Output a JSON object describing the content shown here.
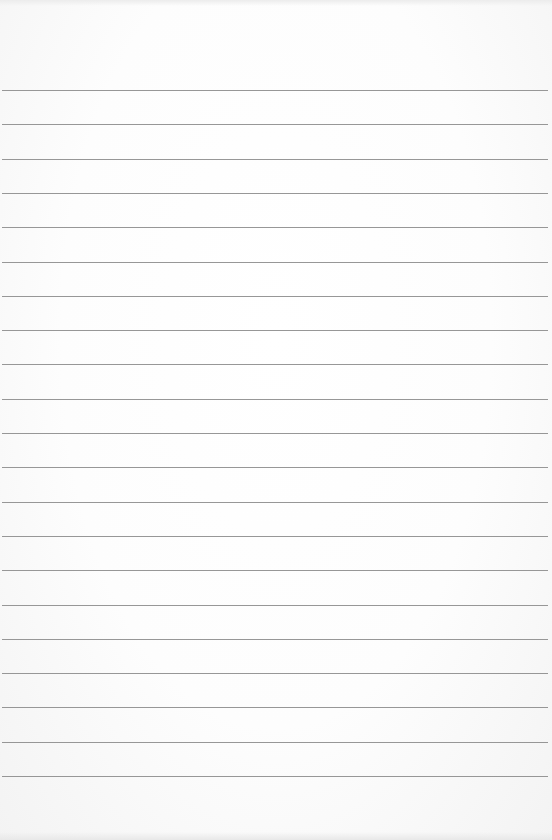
{
  "paper": {
    "type": "lined-paper",
    "background_color": "#fbfbfb",
    "rule_color": "#8c8c8c",
    "rule_count": 21,
    "first_rule_y": 90,
    "rule_spacing": 34.3,
    "rule_left": 2,
    "rule_width": 546
  }
}
